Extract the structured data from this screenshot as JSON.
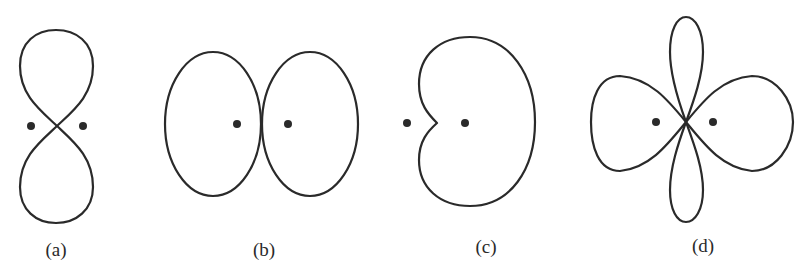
{
  "figure": {
    "panels": [
      {
        "id": "a",
        "label": "(a)",
        "pattern": "figure-eight (vertical lobes)",
        "source_count": 2
      },
      {
        "id": "b",
        "label": "(b)",
        "pattern": "two tangent ellipses (horizontal lobes)",
        "source_count": 2
      },
      {
        "id": "c",
        "label": "(c)",
        "pattern": "cardioid",
        "source_count": 2
      },
      {
        "id": "d",
        "label": "(d)",
        "pattern": "four lobes (two large horizontal, two narrow vertical)",
        "source_count": 2
      }
    ],
    "colors": {
      "stroke": "#2a2a2a",
      "background": "#ffffff"
    }
  }
}
